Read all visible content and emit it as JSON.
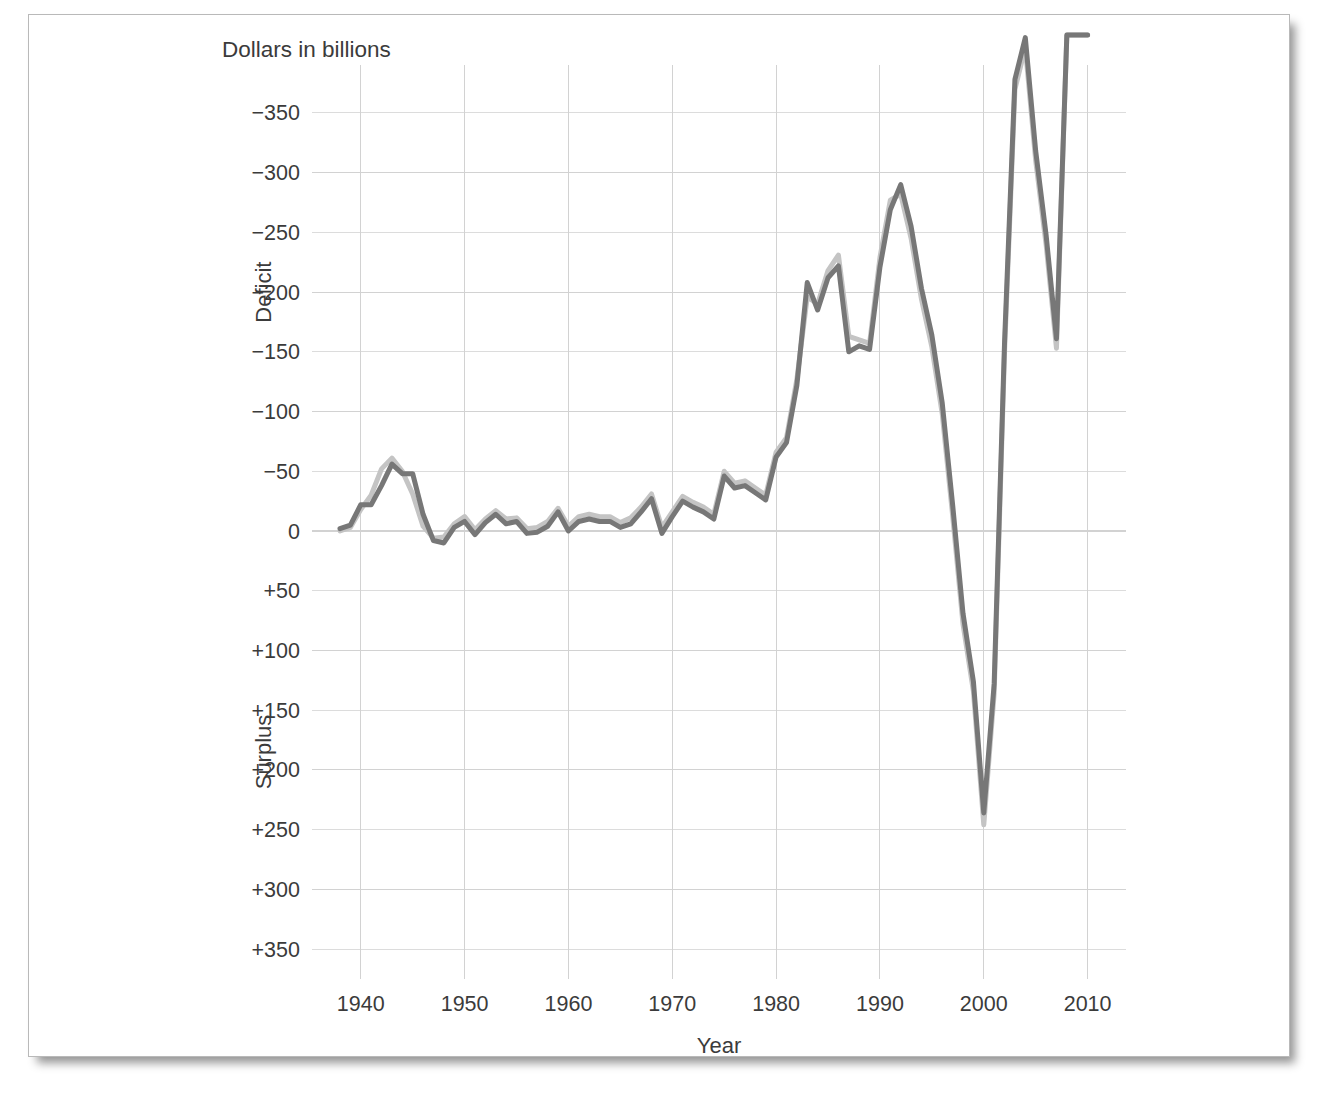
{
  "figure": {
    "unit_note": "Dollars in billions",
    "background_color": "#ffffff",
    "border_color": "#b9b9b9"
  },
  "chart_data": {
    "type": "line",
    "title": "",
    "subtitle": "",
    "unit_label": "Dollars in billions",
    "xlabel": "Year",
    "ylabel": "",
    "ylabel_upper": "Deficit",
    "ylabel_lower": "Surplus",
    "y_axis_inverted": true,
    "grid": true,
    "legend": "none",
    "xlim": [
      1938,
      2011
    ],
    "ylim": [
      -365,
      365
    ],
    "xticks": [
      1940,
      1950,
      1960,
      1970,
      1980,
      1990,
      2000,
      2010
    ],
    "xtick_labels": [
      "1940",
      "1950",
      "1960",
      "1970",
      "1980",
      "1990",
      "2000",
      "2010"
    ],
    "yticks": [
      -350,
      -300,
      -250,
      -200,
      -150,
      -100,
      -50,
      0,
      50,
      100,
      150,
      200,
      250,
      300,
      350
    ],
    "ytick_labels": [
      "−350",
      "−300",
      "−250",
      "−200",
      "−150",
      "−100",
      "−50",
      "0",
      "+50",
      "+100",
      "+150",
      "+200",
      "+250",
      "+300",
      "+350"
    ],
    "x": [
      1938,
      1939,
      1940,
      1941,
      1942,
      1943,
      1944,
      1945,
      1946,
      1947,
      1948,
      1949,
      1950,
      1951,
      1952,
      1953,
      1954,
      1955,
      1956,
      1957,
      1958,
      1959,
      1960,
      1961,
      1962,
      1963,
      1964,
      1965,
      1966,
      1967,
      1968,
      1969,
      1970,
      1971,
      1972,
      1973,
      1974,
      1975,
      1976,
      1977,
      1978,
      1979,
      1980,
      1981,
      1982,
      1983,
      1984,
      1985,
      1986,
      1987,
      1988,
      1989,
      1990,
      1991,
      1992,
      1993,
      1994,
      1995,
      1996,
      1997,
      1998,
      1999,
      2000,
      2001,
      2002,
      2003,
      2004,
      2005,
      2006,
      2007,
      2008,
      2009,
      2010
    ],
    "series": [
      {
        "name": "dark-series",
        "color": "#777777",
        "stroke_width": 5.0,
        "values": [
          -2,
          -5,
          -22,
          -22,
          -38,
          -56,
          -48,
          -48,
          -14,
          8,
          10,
          -3,
          -8,
          3,
          -7,
          -14,
          -6,
          -8,
          2,
          1,
          -4,
          -16,
          0,
          -8,
          -10,
          -8,
          -8,
          -3,
          -6,
          -16,
          -27,
          2,
          -12,
          -25,
          -20,
          -16,
          -10,
          -46,
          -36,
          -38,
          -32,
          -26,
          -62,
          -74,
          -122,
          -208,
          -185,
          -212,
          -222,
          -150,
          -155,
          -152,
          -221,
          -269,
          -290,
          -255,
          -203,
          -164,
          -107,
          -22,
          69,
          126,
          236,
          128,
          -158,
          -378,
          -413,
          -318,
          -248,
          -161,
          -459,
          -1413,
          -1294
        ]
      },
      {
        "name": "light-series",
        "color": "#c4c4c4",
        "stroke_width": 5.0,
        "values": [
          0,
          -3,
          -18,
          -30,
          -52,
          -61,
          -50,
          -31,
          -4,
          6,
          5,
          -6,
          -12,
          -1,
          -10,
          -17,
          -10,
          -11,
          -2,
          -3,
          -8,
          -19,
          -4,
          -12,
          -14,
          -12,
          -12,
          -7,
          -11,
          -20,
          -31,
          -3,
          -16,
          -29,
          -24,
          -20,
          -14,
          -50,
          -40,
          -42,
          -36,
          -30,
          -66,
          -78,
          -127,
          -196,
          -190,
          -218,
          -231,
          -163,
          -160,
          -157,
          -229,
          -277,
          -282,
          -245,
          -194,
          -154,
          -98,
          -13,
          78,
          134,
          246,
          136,
          -150,
          -370,
          -405,
          -310,
          -240,
          -153,
          -452,
          -1405,
          -1290
        ]
      }
    ],
    "annotations": [
      {
        "text": "Dollars in billions",
        "position": "top-left"
      },
      {
        "text": "Deficit",
        "position": "y-axis-upper",
        "rotated": true
      },
      {
        "text": "Surplus",
        "position": "y-axis-lower",
        "rotated": true
      },
      {
        "text": "Year",
        "position": "x-axis-title"
      }
    ]
  }
}
